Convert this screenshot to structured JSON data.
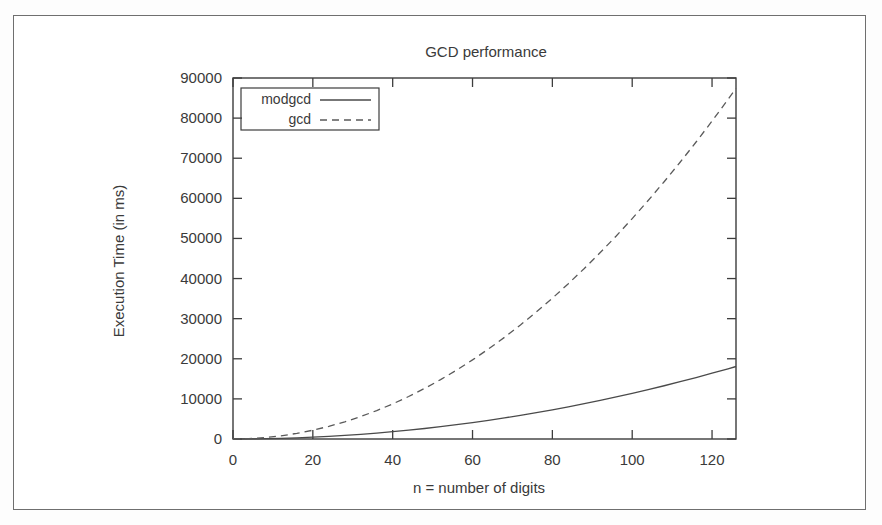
{
  "chart_data": {
    "type": "line",
    "title": "GCD performance",
    "xlabel": "n = number of digits",
    "ylabel": "Execution Time (in ms)",
    "xlim": [
      0,
      126
    ],
    "ylim": [
      0,
      90000
    ],
    "xticks": [
      0,
      20,
      40,
      60,
      80,
      100,
      120
    ],
    "xtick_labels": [
      "0",
      "20",
      "40",
      "60",
      "80",
      "100",
      "120"
    ],
    "yticks": [
      0,
      10000,
      20000,
      30000,
      40000,
      50000,
      60000,
      70000,
      80000,
      90000
    ],
    "ytick_labels": [
      "0",
      "10000",
      "20000",
      "30000",
      "40000",
      "50000",
      "60000",
      "70000",
      "80000",
      "90000"
    ],
    "grid": false,
    "legend_position": "top-left-inside",
    "x": [
      0,
      4,
      8,
      12,
      16,
      20,
      24,
      28,
      32,
      36,
      40,
      44,
      48,
      52,
      56,
      60,
      64,
      68,
      72,
      76,
      80,
      84,
      88,
      92,
      96,
      100,
      104,
      108,
      112,
      116,
      120,
      124,
      126
    ],
    "series": [
      {
        "name": "modgcd",
        "style": "solid",
        "values": [
          0,
          20,
          75,
          165,
          290,
          455,
          655,
          890,
          1160,
          1470,
          1815,
          2195,
          2615,
          3070,
          3560,
          4090,
          4655,
          5255,
          5895,
          6570,
          7280,
          8025,
          8810,
          9630,
          10485,
          11380,
          12310,
          13275,
          14280,
          15320,
          16395,
          17510,
          18075
        ]
      },
      {
        "name": "gcd",
        "style": "dashed",
        "values": [
          0,
          90,
          350,
          790,
          1400,
          2190,
          3150,
          4290,
          5600,
          7090,
          8750,
          10590,
          12610,
          14800,
          17170,
          19720,
          22440,
          25340,
          28420,
          31670,
          35110,
          38720,
          42510,
          46480,
          50620,
          54950,
          59450,
          64140,
          69000,
          74040,
          79260,
          84660,
          87410
        ]
      }
    ]
  }
}
